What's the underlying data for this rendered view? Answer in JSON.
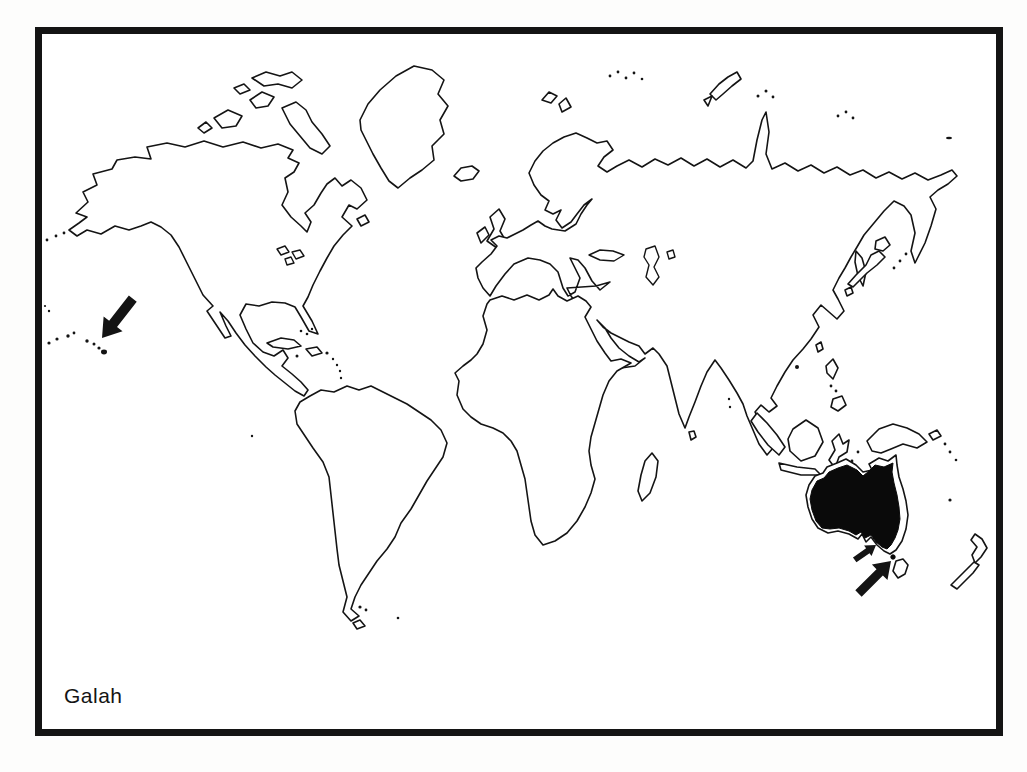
{
  "figure": {
    "caption": "Galah",
    "kind": "species distribution range map (black-and-white scan)",
    "colors": {
      "ink": "#141414",
      "paper": "#ffffff",
      "page": "#fdfdfc",
      "range_fill": "#0a0a0a"
    },
    "range": {
      "region": "Australia",
      "style": "solid black fill inside coastline outline"
    },
    "markers": [
      {
        "id": "hawaii-arrow",
        "shape": "thick arrow",
        "direction": "pointing southwest",
        "size": "large",
        "points_at": "Hawaiian Islands dots"
      },
      {
        "id": "south-australia-arrow",
        "shape": "thick arrow",
        "direction": "pointing northeast",
        "size": "small",
        "points_at": "south-eastern Australian coast"
      },
      {
        "id": "tasmania-arrow",
        "shape": "thick arrow",
        "direction": "pointing northeast",
        "size": "large",
        "points_at": "Tasmania / Bass Strait islet"
      }
    ]
  }
}
